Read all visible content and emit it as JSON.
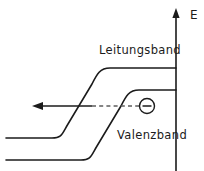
{
  "figure": {
    "kind": "semiconductor-band-diagram",
    "background_color": "#ffffff",
    "line_color": "#1b1b1b",
    "dashed_color": "#5d5d5d",
    "width": 204,
    "height": 171
  },
  "labels": {
    "conduction_band": "Leitungsband",
    "valence_band": "Valenzband",
    "energy_axis": "E"
  },
  "axis": {
    "name": "energy-axis",
    "orientation": "vertical",
    "arrow_direction": "up",
    "x": 176,
    "y_top": 12,
    "y_bottom": 171
  },
  "bands": [
    {
      "name": "conduction-band",
      "label": "Leitungsband",
      "left_level_y": 138,
      "right_level_y": 68,
      "step_start_x": 55,
      "step_end_x": 108,
      "left_start_x": 6,
      "right_end_x": 176
    },
    {
      "name": "valence-band",
      "label": "Valenzband",
      "left_level_y": 160,
      "right_level_y": 90,
      "step_start_x": 84,
      "step_end_x": 137,
      "left_start_x": 6,
      "right_end_x": 176
    }
  ],
  "transition": {
    "name": "carrier-transition-path",
    "y": 106,
    "arrow_tip_x": 33,
    "solid_start_x": 42,
    "solid_end_x": 92,
    "dashed_start_x": 92,
    "dashed_end_x": 139,
    "arrow_direction": "left"
  },
  "carrier": {
    "name": "electron",
    "symbol": "minus",
    "center_x": 147,
    "center_y": 106,
    "radius": 7.5
  }
}
